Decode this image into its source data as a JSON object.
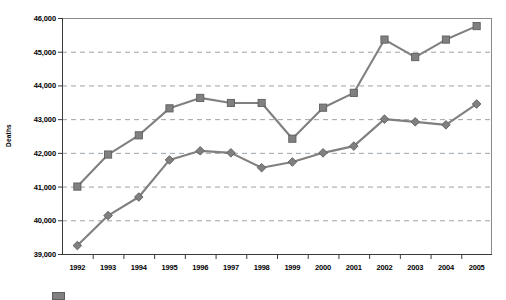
{
  "chart_data": {
    "type": "line",
    "title": "",
    "xlabel": "",
    "ylabel": "Deaths",
    "categories": [
      "1992",
      "1993",
      "1994",
      "1995",
      "1996",
      "1997",
      "1998",
      "1999",
      "2000",
      "2001",
      "2002",
      "2003",
      "2004",
      "2005"
    ],
    "ylim": [
      39000,
      46000
    ],
    "ytick_labels": [
      "39,000",
      "40,000",
      "41,000",
      "42,000",
      "43,000",
      "44,000",
      "45,000",
      "46,000"
    ],
    "yticks": [
      39000,
      40000,
      41000,
      42000,
      43000,
      44000,
      45000,
      46000
    ],
    "grid": "horizontal-dashed",
    "legend_position": "bottom-left",
    "series": [
      {
        "name": "series-squares",
        "marker": "square",
        "color": "#808080",
        "values": [
          41000,
          41950,
          42520,
          43320,
          43630,
          43480,
          43480,
          42420,
          43340,
          43780,
          45360,
          44840,
          45360,
          45760
        ]
      },
      {
        "name": "series-diamonds",
        "marker": "diamond",
        "color": "#808080",
        "values": [
          39250,
          40140,
          40690,
          41790,
          42060,
          42000,
          41560,
          41730,
          42000,
          42200,
          43000,
          42920,
          42830,
          43450
        ]
      }
    ],
    "legend_entries": [
      {
        "label": "",
        "marker": "square",
        "color": "#808080"
      }
    ]
  },
  "colors": {
    "series": "#808080",
    "marker_edge": "#5f5f5f",
    "gridline": "#9aa3ad",
    "axis": "#555555",
    "frame": "#8a8a8a",
    "text": "#000000",
    "background": "#ffffff"
  }
}
